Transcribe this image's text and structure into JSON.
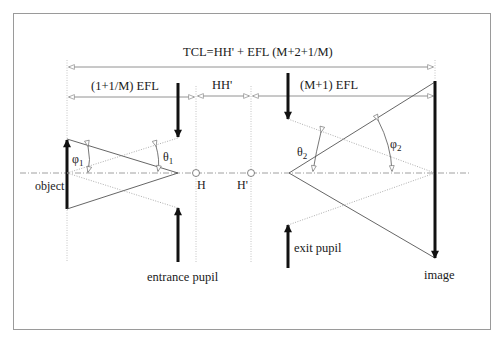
{
  "diagram": {
    "dimensions": {
      "total": "TCL=HH' + EFL (M+2+1/M)",
      "object_side": "(1+1/M) EFL",
      "principal_gap": "HH'",
      "image_side": "(M+1) EFL"
    },
    "points": {
      "H": "H",
      "H_prime": "H'"
    },
    "angles": {
      "phi1": "φ",
      "phi1_sub": "1",
      "theta1": "θ",
      "theta1_sub": "1",
      "theta2": "θ",
      "theta2_sub": "2",
      "phi2": "φ",
      "phi2_sub": "2"
    },
    "labels": {
      "object": "object",
      "entrance_pupil": "entrance pupil",
      "exit_pupil": "exit pupil",
      "image": "image"
    },
    "colors": {
      "frame": "#9a9a9a",
      "line": "#555555",
      "arrow": "#111111",
      "dotted": "#9a9a9a"
    }
  }
}
